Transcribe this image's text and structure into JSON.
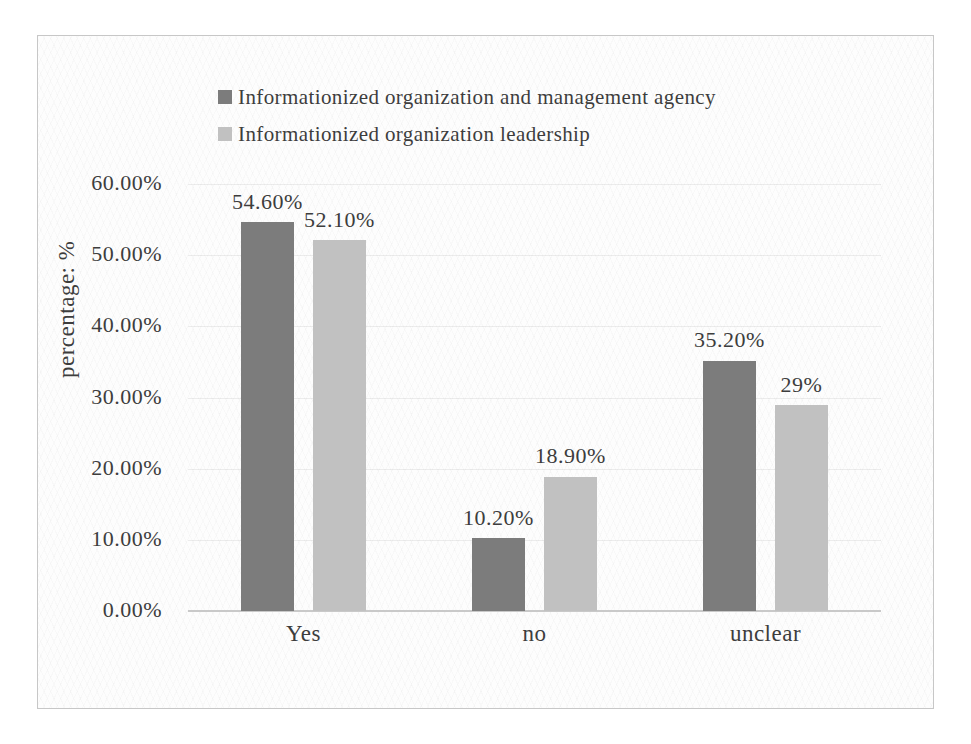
{
  "chart_data": {
    "type": "bar",
    "title": "",
    "categories": [
      "Yes",
      "no",
      "unclear"
    ],
    "series": [
      {
        "name": "Informationized organization and management agency",
        "color": "#7c7c7c",
        "values": [
          54.6,
          10.2,
          35.2
        ],
        "value_labels": [
          "54.60%",
          "10.20%",
          "35.20%"
        ]
      },
      {
        "name": "Informationized organization leadership",
        "color": "#c1c1c1",
        "values": [
          52.1,
          18.9,
          29
        ],
        "value_labels": [
          "52.10%",
          "18.90%",
          "29%"
        ]
      }
    ],
    "xlabel": "",
    "ylabel": "percentage: %",
    "ylim": [
      0,
      60
    ],
    "yticks": [
      {
        "value": 0,
        "label": "0.00%"
      },
      {
        "value": 10,
        "label": "10.00%"
      },
      {
        "value": 20,
        "label": "20.00%"
      },
      {
        "value": 30,
        "label": "30.00%"
      },
      {
        "value": 40,
        "label": "40.00%"
      },
      {
        "value": 50,
        "label": "50.00%"
      },
      {
        "value": 60,
        "label": "60.00%"
      }
    ],
    "grid": true,
    "legend_position": "top-center"
  },
  "colors": {
    "text": "#3d3d3d",
    "gridline": "#e8e8e8",
    "axis_line": "#c9c9c9",
    "frame_border": "#c7c7c7"
  }
}
